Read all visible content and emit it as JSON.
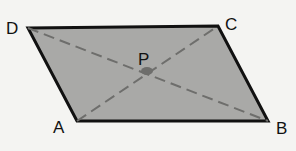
{
  "diagram": {
    "type": "parallelogram",
    "fill_color": "#a9a9a7",
    "edge_color": "#111111",
    "diagonal_color": "#6e6e6c",
    "vertices": {
      "A": {
        "label": "A",
        "x": 77,
        "y": 121
      },
      "B": {
        "label": "B",
        "x": 268,
        "y": 121
      },
      "C": {
        "label": "C",
        "x": 218,
        "y": 26
      },
      "D": {
        "label": "D",
        "x": 28,
        "y": 28
      }
    },
    "intersection": {
      "label": "P",
      "x": 147,
      "y": 71
    },
    "diagonals": [
      "AC",
      "BD"
    ]
  }
}
